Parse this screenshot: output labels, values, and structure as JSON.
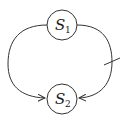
{
  "diagram": {
    "type": "state-graph",
    "nodes": [
      {
        "id": "s1",
        "label": "S",
        "subscript": "1"
      },
      {
        "id": "s2",
        "label": "S",
        "subscript": "2"
      }
    ],
    "edges": [
      {
        "from": "s1",
        "to": "s2",
        "side": "left",
        "marked": false
      },
      {
        "from": "s1",
        "to": "s2",
        "side": "right",
        "marked": true,
        "mark": "tick"
      }
    ],
    "colors": {
      "stroke": "#333333",
      "background": "#ffffff"
    }
  }
}
